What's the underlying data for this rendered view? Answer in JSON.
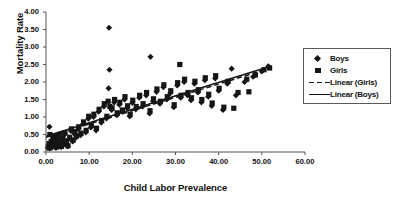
{
  "chart_data": {
    "type": "scatter",
    "title": "",
    "xlabel": "Child Labor Prevalence",
    "ylabel": "Mortality Rate",
    "xlim": [
      0,
      60
    ],
    "ylim": [
      0,
      4
    ],
    "xticks": [
      "0.00",
      "10.00",
      "20.00",
      "30.00",
      "40.00",
      "50.00",
      "60.00"
    ],
    "yticks": [
      "0.00",
      "0.50",
      "1.00",
      "1.50",
      "2.00",
      "2.50",
      "3.00",
      "3.50",
      "4.00"
    ],
    "grid": false,
    "legend_position": "top-right",
    "legend": [
      {
        "label": "Boys",
        "marker": "diamond",
        "style": "marker"
      },
      {
        "label": "Girls",
        "marker": "square",
        "style": "marker"
      },
      {
        "label": "Linear (Girls)",
        "marker": "dashed-line",
        "style": "line"
      },
      {
        "label": "Linear (Boys)",
        "marker": "solid-line",
        "style": "line"
      }
    ],
    "series": [
      {
        "name": "Boys",
        "marker": "diamond",
        "color": "#151515",
        "points": [
          [
            0.4,
            0.12
          ],
          [
            0.6,
            0.2
          ],
          [
            0.9,
            0.1
          ],
          [
            1.1,
            0.26
          ],
          [
            1.3,
            0.15
          ],
          [
            1.5,
            0.33
          ],
          [
            1.7,
            0.18
          ],
          [
            1.9,
            0.4
          ],
          [
            2.1,
            0.22
          ],
          [
            2.3,
            0.12
          ],
          [
            2.6,
            0.3
          ],
          [
            2.8,
            0.18
          ],
          [
            3.0,
            0.45
          ],
          [
            3.2,
            0.25
          ],
          [
            3.5,
            0.14
          ],
          [
            3.8,
            0.35
          ],
          [
            4.0,
            0.2
          ],
          [
            4.3,
            0.5
          ],
          [
            4.6,
            0.28
          ],
          [
            5.0,
            0.16
          ],
          [
            0.8,
            0.72
          ],
          [
            5.4,
            0.38
          ],
          [
            5.8,
            0.6
          ],
          [
            6.2,
            0.3
          ],
          [
            6.6,
            0.52
          ],
          [
            7.0,
            0.42
          ],
          [
            7.5,
            0.66
          ],
          [
            8.0,
            0.48
          ],
          [
            8.6,
            0.8
          ],
          [
            9.2,
            0.56
          ],
          [
            9.8,
            0.95
          ],
          [
            10.4,
            0.7
          ],
          [
            11.0,
            1.0
          ],
          [
            11.6,
            0.62
          ],
          [
            12.2,
            1.15
          ],
          [
            12.8,
            0.84
          ],
          [
            13.4,
            1.3
          ],
          [
            14.0,
            0.96
          ],
          [
            14.5,
            1.82
          ],
          [
            14.6,
            3.55
          ],
          [
            14.7,
            2.35
          ],
          [
            15.2,
            1.2
          ],
          [
            15.8,
            1.42
          ],
          [
            16.4,
            1.05
          ],
          [
            17.0,
            1.35
          ],
          [
            17.6,
            1.15
          ],
          [
            18.2,
            1.5
          ],
          [
            18.8,
            1.25
          ],
          [
            19.4,
            1.02
          ],
          [
            20.0,
            1.4
          ],
          [
            20.8,
            1.22
          ],
          [
            21.6,
            1.55
          ],
          [
            22.4,
            1.3
          ],
          [
            23.2,
            1.62
          ],
          [
            24.0,
            1.1
          ],
          [
            24.2,
            2.72
          ],
          [
            24.8,
            1.45
          ],
          [
            25.6,
            1.72
          ],
          [
            26.4,
            1.38
          ],
          [
            27.2,
            1.85
          ],
          [
            28.0,
            1.5
          ],
          [
            28.8,
            1.68
          ],
          [
            29.6,
            1.28
          ],
          [
            30.4,
            1.9
          ],
          [
            31.2,
            1.55
          ],
          [
            32.0,
            2.0
          ],
          [
            32.8,
            1.62
          ],
          [
            33.6,
            1.48
          ],
          [
            34.4,
            1.95
          ],
          [
            35.2,
            1.7
          ],
          [
            36.0,
            1.42
          ],
          [
            36.8,
            2.05
          ],
          [
            37.6,
            1.58
          ],
          [
            38.4,
            1.32
          ],
          [
            39.2,
            2.1
          ],
          [
            40.0,
            1.75
          ],
          [
            41.0,
            1.2
          ],
          [
            42.0,
            1.95
          ],
          [
            43.0,
            2.38
          ],
          [
            44.0,
            1.62
          ],
          [
            46.0,
            2.0
          ],
          [
            48.0,
            2.15
          ],
          [
            50.0,
            2.3
          ],
          [
            51.5,
            2.45
          ]
        ]
      },
      {
        "name": "Girls",
        "marker": "square",
        "color": "#151515",
        "points": [
          [
            0.5,
            0.14
          ],
          [
            0.7,
            0.24
          ],
          [
            1.0,
            0.12
          ],
          [
            1.2,
            0.3
          ],
          [
            1.4,
            0.18
          ],
          [
            1.6,
            0.38
          ],
          [
            1.8,
            0.2
          ],
          [
            2.0,
            0.46
          ],
          [
            2.2,
            0.26
          ],
          [
            2.4,
            0.14
          ],
          [
            2.7,
            0.34
          ],
          [
            2.9,
            0.2
          ],
          [
            3.1,
            0.5
          ],
          [
            3.3,
            0.28
          ],
          [
            3.6,
            0.16
          ],
          [
            3.9,
            0.4
          ],
          [
            4.1,
            0.24
          ],
          [
            4.4,
            0.55
          ],
          [
            4.7,
            0.32
          ],
          [
            5.1,
            0.18
          ],
          [
            0.9,
            0.5
          ],
          [
            5.5,
            0.42
          ],
          [
            5.9,
            0.66
          ],
          [
            6.3,
            0.34
          ],
          [
            6.7,
            0.58
          ],
          [
            7.1,
            0.46
          ],
          [
            7.6,
            0.72
          ],
          [
            8.1,
            0.54
          ],
          [
            8.7,
            0.86
          ],
          [
            9.3,
            0.62
          ],
          [
            9.9,
            1.02
          ],
          [
            10.5,
            0.76
          ],
          [
            11.1,
            1.08
          ],
          [
            11.7,
            0.68
          ],
          [
            12.3,
            1.22
          ],
          [
            12.9,
            0.9
          ],
          [
            13.5,
            1.38
          ],
          [
            14.1,
            1.02
          ],
          [
            14.4,
            1.45
          ],
          [
            14.8,
            1.3
          ],
          [
            15.3,
            1.26
          ],
          [
            15.9,
            1.5
          ],
          [
            16.5,
            1.12
          ],
          [
            17.1,
            1.42
          ],
          [
            17.7,
            1.2
          ],
          [
            18.3,
            1.58
          ],
          [
            18.9,
            1.32
          ],
          [
            19.5,
            1.08
          ],
          [
            20.1,
            1.48
          ],
          [
            20.9,
            1.3
          ],
          [
            21.7,
            1.62
          ],
          [
            22.5,
            1.38
          ],
          [
            23.3,
            1.7
          ],
          [
            24.1,
            1.18
          ],
          [
            24.9,
            1.52
          ],
          [
            25.7,
            1.8
          ],
          [
            26.5,
            1.45
          ],
          [
            27.3,
            1.92
          ],
          [
            28.1,
            1.58
          ],
          [
            28.9,
            1.75
          ],
          [
            29.7,
            1.35
          ],
          [
            30.5,
            1.98
          ],
          [
            31.3,
            1.62
          ],
          [
            32.1,
            2.08
          ],
          [
            32.9,
            1.7
          ],
          [
            33.7,
            1.55
          ],
          [
            34.5,
            2.02
          ],
          [
            35.3,
            1.78
          ],
          [
            36.1,
            1.5
          ],
          [
            36.9,
            2.12
          ],
          [
            37.7,
            1.65
          ],
          [
            38.5,
            1.4
          ],
          [
            39.3,
            2.18
          ],
          [
            40.1,
            1.82
          ],
          [
            41.2,
            1.28
          ],
          [
            42.2,
            2.02
          ],
          [
            43.5,
            1.25
          ],
          [
            44.5,
            1.7
          ],
          [
            31.0,
            2.5
          ],
          [
            46.5,
            2.08
          ],
          [
            48.5,
            2.2
          ],
          [
            50.5,
            2.35
          ],
          [
            51.8,
            2.4
          ],
          [
            47.0,
            1.72
          ]
        ]
      }
    ],
    "trendlines": [
      {
        "name": "Linear (Boys)",
        "style": "solid",
        "x_start": 0.0,
        "y_start": 0.45,
        "x_end": 52.0,
        "y_end": 2.45
      },
      {
        "name": "Linear (Girls)",
        "style": "dashed",
        "x_start": 0.0,
        "y_start": 0.42,
        "x_end": 52.0,
        "y_end": 2.4
      }
    ]
  }
}
